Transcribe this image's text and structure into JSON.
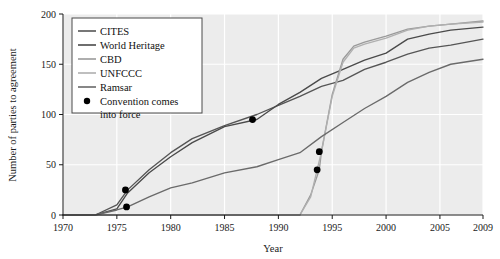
{
  "chart_data": {
    "type": "line",
    "title": "",
    "xlabel": "Year",
    "ylabel": "Number of parties to agreement",
    "xlim": [
      1970,
      2009
    ],
    "ylim": [
      0,
      200
    ],
    "xticks": [
      1970,
      1975,
      1980,
      1985,
      1990,
      1995,
      2000,
      2005,
      2009
    ],
    "yticks": [
      0,
      50,
      100,
      150,
      200
    ],
    "grid": true,
    "legend_position": "top-left",
    "plot_background": "#ececec",
    "gridline_color": "#ffffff",
    "series": [
      {
        "name": "CITES",
        "color": "#555555",
        "x": [
          1970,
          1973,
          1975,
          1976,
          1978,
          1980,
          1982,
          1985,
          1988,
          1990,
          1992,
          1994,
          1996,
          1998,
          2000,
          2002,
          2004,
          2006,
          2009
        ],
        "values": [
          0,
          0,
          10,
          25,
          45,
          62,
          76,
          89,
          100,
          109,
          118,
          128,
          134,
          145,
          152,
          160,
          166,
          169,
          175
        ]
      },
      {
        "name": "World Heritage",
        "color": "#4a4a4a",
        "x": [
          1970,
          1973,
          1975,
          1976,
          1978,
          1980,
          1982,
          1985,
          1988,
          1990,
          1992,
          1994,
          1996,
          1998,
          2000,
          2002,
          2004,
          2006,
          2009
        ],
        "values": [
          0,
          0,
          6,
          22,
          42,
          58,
          72,
          88,
          95,
          110,
          122,
          136,
          145,
          154,
          161,
          175,
          180,
          184,
          187
        ]
      },
      {
        "name": "CBD",
        "color": "#9a9a9a",
        "x": [
          1970,
          1990,
          1992,
          1993,
          1993.8,
          1994,
          1995,
          1996,
          1997,
          1998,
          2000,
          2002,
          2004,
          2006,
          2009
        ],
        "values": [
          0,
          0,
          0,
          20,
          45,
          63,
          120,
          155,
          168,
          172,
          178,
          185,
          188,
          190,
          193
        ]
      },
      {
        "name": "UNFCCC",
        "color": "#b0b0b0",
        "x": [
          1970,
          1990,
          1992,
          1993,
          1993.6,
          1994,
          1995,
          1996,
          1997,
          1998,
          2000,
          2002,
          2004,
          2006,
          2009
        ],
        "values": [
          0,
          0,
          0,
          18,
          45,
          63,
          118,
          152,
          166,
          170,
          176,
          184,
          188,
          190,
          192
        ]
      },
      {
        "name": "Ramsar",
        "color": "#6a6a6a",
        "x": [
          1970,
          1973,
          1975,
          1976,
          1978,
          1980,
          1982,
          1985,
          1988,
          1990,
          1992,
          1994,
          1996,
          1998,
          2000,
          2002,
          2004,
          2006,
          2009
        ],
        "values": [
          0,
          0,
          5,
          8,
          18,
          27,
          32,
          42,
          48,
          55,
          62,
          78,
          92,
          106,
          118,
          132,
          142,
          150,
          155
        ]
      }
    ],
    "markers": {
      "label": "Convention comes into force",
      "color": "#000000",
      "points": [
        {
          "x": 1975.8,
          "y": 25,
          "series": "World Heritage"
        },
        {
          "x": 1975.9,
          "y": 8,
          "series": "Ramsar"
        },
        {
          "x": 1987.6,
          "y": 95,
          "series": "CITES"
        },
        {
          "x": 1993.8,
          "y": 63,
          "series": "CBD"
        },
        {
          "x": 1993.6,
          "y": 45,
          "series": "UNFCCC"
        }
      ]
    },
    "legend_entries": [
      {
        "label": "CITES",
        "type": "line",
        "color": "#555555"
      },
      {
        "label": "World Heritage",
        "type": "line",
        "color": "#4a4a4a"
      },
      {
        "label": "CBD",
        "type": "line",
        "color": "#9a9a9a"
      },
      {
        "label": "UNFCCC",
        "type": "line",
        "color": "#b0b0b0"
      },
      {
        "label": "Ramsar",
        "type": "line",
        "color": "#6a6a6a"
      },
      {
        "label": "Convention comes into force",
        "type": "marker",
        "color": "#000000"
      }
    ],
    "legend_wrapped_lines": [
      "Convention comes",
      "into force"
    ]
  }
}
